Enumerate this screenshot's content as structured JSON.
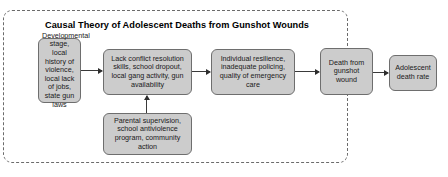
{
  "diagram": {
    "title": "Causal Theory of Adolescent Deaths from Gunshot Wounds",
    "type": "flowchart",
    "colors": {
      "node_fill": "#cccccc",
      "node_border": "#6e6e6e",
      "boundary_border": "#6b6b6b",
      "arrow": "#2e2e2e",
      "background": "#ffffff",
      "text": "#1a1a1a"
    },
    "boundary": {
      "style": "dashed",
      "shape": "rounded-rectangle",
      "label": "system boundary"
    },
    "nodes": [
      {
        "id": "developmental",
        "text": "Developmental stage, local history of violence, local lack of jobs, state gun laws",
        "role": "context-inputs"
      },
      {
        "id": "conflict",
        "text": "Lack conflict resolution skills, school dropout, local gang activity, gun availability",
        "role": "risk-factors"
      },
      {
        "id": "parental",
        "text": "Parental supervision, school antiviolence program, community action",
        "role": "protective-factors"
      },
      {
        "id": "resilience",
        "text": "Individual resilience, inadequate policing, quality of emergency care",
        "role": "mediating-factors"
      },
      {
        "id": "death",
        "text": "Death from gunshot wound",
        "role": "outcome-event"
      },
      {
        "id": "rate",
        "text": "Adolescent death rate",
        "role": "final-outcome"
      }
    ],
    "edges": [
      {
        "id": "dev-to-conflict",
        "from": "developmental",
        "to": "conflict",
        "direction": "right"
      },
      {
        "id": "conflict-to-resilience",
        "from": "conflict",
        "to": "resilience",
        "direction": "right"
      },
      {
        "id": "resilience-to-death",
        "from": "resilience",
        "to": "death",
        "direction": "right"
      },
      {
        "id": "death-to-rate",
        "from": "death",
        "to": "rate",
        "direction": "right"
      },
      {
        "id": "parental-to-conflict",
        "from": "parental",
        "to": "conflict",
        "direction": "up"
      }
    ]
  }
}
